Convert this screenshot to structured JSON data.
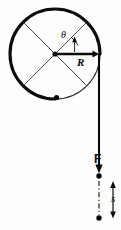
{
  "figure": {
    "background_color": "#fefefe",
    "ink_color": "#0b0b0b",
    "width": 121,
    "height": 230,
    "labels": {
      "angle": "θ",
      "radius": "R",
      "force": "F",
      "displacement": "s"
    },
    "elements": {
      "disk_label": "disk-rim",
      "spoke_a_label": "spoke-upper-left-to-lower-right",
      "spoke_b_label": "spoke-upper-right-to-lower-left",
      "center_label": "disk-center-dot",
      "rim_point_label": "rim-reference-dot",
      "radius_arrow_label": "radius-arrow",
      "angle_arc_label": "angle-arc-arrow",
      "cord_label": "cord-line",
      "force_arrow_label": "force-arrow",
      "cord_end_dot_label": "cord-end-dot",
      "final_dot_label": "final-position-dot",
      "dashdot_label": "displacement-path",
      "s_arrow_label": "displacement-arrow"
    },
    "geometry": {
      "circle_center_x": 55,
      "circle_center_y": 54,
      "circle_radius": 45,
      "cord_x": 99,
      "cord_top_y": 54,
      "cord_arrow_tip_y": 173,
      "cord_end_dot_y": 175,
      "final_dot_y": 218,
      "s_arrow_x": 113,
      "s_arrow_top_y": 181,
      "s_arrow_bottom_y": 218
    }
  }
}
